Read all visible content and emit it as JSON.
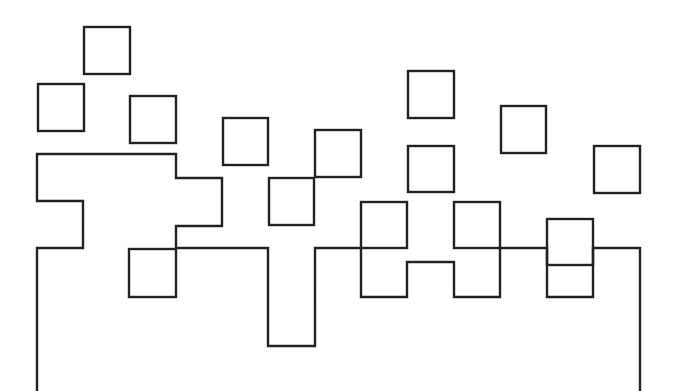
{
  "canvas": {
    "width": 678,
    "height": 391,
    "background": "#ffffff",
    "stroke": "#222222"
  },
  "diagram": {
    "outline": {
      "name": "skyline-outline",
      "points": [
        [
          37,
          391
        ],
        [
          37,
          248
        ],
        [
          83,
          248
        ],
        [
          83,
          201
        ],
        [
          37,
          201
        ],
        [
          37,
          154
        ],
        [
          176,
          154
        ],
        [
          176,
          178
        ],
        [
          222,
          178
        ],
        [
          222,
          226
        ],
        [
          176,
          226
        ],
        [
          176,
          248
        ],
        [
          268,
          248
        ],
        [
          268,
          346
        ],
        [
          315,
          346
        ],
        [
          315,
          248
        ],
        [
          361,
          248
        ],
        [
          361,
          297
        ],
        [
          407,
          297
        ],
        [
          407,
          262
        ],
        [
          454,
          262
        ],
        [
          454,
          297
        ],
        [
          500,
          297
        ],
        [
          500,
          248
        ],
        [
          547,
          248
        ],
        [
          547,
          297
        ],
        [
          593,
          297
        ],
        [
          593,
          248
        ],
        [
          640,
          248
        ],
        [
          640,
          391
        ]
      ]
    },
    "squares": [
      {
        "x": 84,
        "y": 27,
        "w": 46,
        "h": 47
      },
      {
        "x": 38,
        "y": 84,
        "w": 46,
        "h": 47
      },
      {
        "x": 130,
        "y": 96,
        "w": 46,
        "h": 47
      },
      {
        "x": 223,
        "y": 118,
        "w": 45,
        "h": 47
      },
      {
        "x": 315,
        "y": 130,
        "w": 46,
        "h": 47
      },
      {
        "x": 269,
        "y": 178,
        "w": 45,
        "h": 47
      },
      {
        "x": 408,
        "y": 71,
        "w": 46,
        "h": 47
      },
      {
        "x": 501,
        "y": 106,
        "w": 45,
        "h": 47
      },
      {
        "x": 408,
        "y": 146,
        "w": 46,
        "h": 46
      },
      {
        "x": 594,
        "y": 146,
        "w": 46,
        "h": 47
      },
      {
        "x": 361,
        "y": 202,
        "w": 46,
        "h": 46
      },
      {
        "x": 454,
        "y": 202,
        "w": 46,
        "h": 46
      },
      {
        "x": 547,
        "y": 219,
        "w": 46,
        "h": 46
      },
      {
        "x": 129,
        "y": 249,
        "w": 47,
        "h": 48
      }
    ]
  }
}
